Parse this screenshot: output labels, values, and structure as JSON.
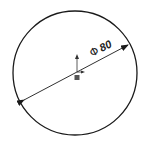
{
  "drawing": {
    "shape": "circle",
    "center": [
      75,
      73
    ],
    "radius": 62,
    "stroke_color": "#1a1a1a",
    "dimension": {
      "type": "diameter",
      "symbol": "Φ",
      "value": "80",
      "line_start": [
        20,
        102
      ],
      "line_end": [
        132,
        43
      ],
      "arrows": "both-inside"
    },
    "origin_marker": {
      "position": [
        77,
        72
      ],
      "icon": "origin-axes-icon"
    }
  },
  "captions": {
    "left": "",
    "right": ""
  }
}
